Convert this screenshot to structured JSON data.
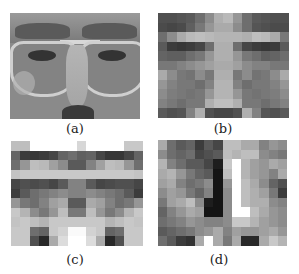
{
  "figure": {
    "panels": [
      {
        "id": "a",
        "label": "(a)",
        "type": "grayscale face photograph (eye region with glasses)"
      },
      {
        "id": "b",
        "label": "(b)",
        "type": "pixelated mosaic of face",
        "cols": 14,
        "rows": 11,
        "cells": [
          [
            80,
            80,
            85,
            90,
            110,
            140,
            175,
            185,
            150,
            110,
            90,
            85,
            80,
            80
          ],
          [
            75,
            70,
            75,
            95,
            120,
            150,
            170,
            170,
            140,
            110,
            85,
            80,
            75,
            75
          ],
          [
            110,
            140,
            170,
            185,
            190,
            185,
            180,
            180,
            180,
            175,
            190,
            185,
            170,
            120
          ],
          [
            90,
            60,
            55,
            60,
            70,
            110,
            175,
            175,
            110,
            70,
            60,
            55,
            60,
            90
          ],
          [
            100,
            95,
            95,
            110,
            120,
            150,
            175,
            175,
            150,
            120,
            110,
            95,
            100,
            110
          ],
          [
            120,
            120,
            130,
            140,
            150,
            160,
            170,
            170,
            160,
            140,
            130,
            130,
            120,
            120
          ],
          [
            170,
            140,
            120,
            115,
            140,
            120,
            175,
            175,
            120,
            140,
            115,
            120,
            140,
            170
          ],
          [
            150,
            130,
            120,
            120,
            110,
            130,
            180,
            180,
            130,
            110,
            120,
            120,
            130,
            150
          ],
          [
            140,
            125,
            120,
            115,
            120,
            150,
            180,
            180,
            150,
            120,
            115,
            120,
            125,
            140
          ],
          [
            130,
            120,
            110,
            120,
            120,
            175,
            190,
            190,
            175,
            120,
            120,
            110,
            120,
            130
          ],
          [
            90,
            80,
            85,
            130,
            175,
            80,
            70,
            70,
            80,
            175,
            130,
            85,
            80,
            90
          ]
        ]
      },
      {
        "id": "c",
        "label": "(c)",
        "type": "pixelated feature mosaic",
        "cols": 14,
        "rows": 11,
        "cells": [
          [
            190,
            190,
            255,
            255,
            255,
            255,
            255,
            215,
            255,
            255,
            255,
            255,
            200,
            200
          ],
          [
            100,
            60,
            55,
            60,
            70,
            100,
            110,
            95,
            100,
            70,
            55,
            55,
            70,
            100
          ],
          [
            110,
            150,
            190,
            185,
            160,
            140,
            90,
            90,
            130,
            160,
            190,
            185,
            150,
            110
          ],
          [
            195,
            200,
            200,
            200,
            200,
            200,
            200,
            200,
            200,
            200,
            200,
            200,
            200,
            195
          ],
          [
            70,
            80,
            75,
            80,
            70,
            90,
            130,
            130,
            90,
            70,
            75,
            80,
            80,
            70
          ],
          [
            60,
            90,
            110,
            120,
            130,
            140,
            130,
            130,
            140,
            130,
            120,
            110,
            90,
            60
          ],
          [
            150,
            120,
            110,
            130,
            160,
            170,
            90,
            90,
            170,
            160,
            130,
            110,
            120,
            150
          ],
          [
            200,
            180,
            140,
            120,
            150,
            190,
            120,
            120,
            190,
            150,
            120,
            140,
            180,
            200
          ],
          [
            195,
            200,
            190,
            180,
            200,
            200,
            200,
            200,
            200,
            200,
            180,
            190,
            200,
            195
          ],
          [
            200,
            200,
            110,
            100,
            200,
            210,
            250,
            250,
            210,
            200,
            100,
            110,
            200,
            200
          ],
          [
            200,
            200,
            80,
            40,
            170,
            220,
            255,
            255,
            220,
            170,
            40,
            80,
            200,
            200
          ]
        ]
      },
      {
        "id": "d",
        "label": "(d)",
        "type": "pixelated feature mosaic",
        "cols": 14,
        "rows": 11,
        "cells": [
          [
            170,
            110,
            90,
            100,
            60,
            90,
            70,
            190,
            190,
            170,
            170,
            130,
            150,
            140
          ],
          [
            140,
            110,
            100,
            110,
            70,
            80,
            90,
            190,
            180,
            190,
            190,
            140,
            130,
            120
          ],
          [
            180,
            130,
            110,
            90,
            90,
            70,
            30,
            200,
            255,
            180,
            160,
            150,
            170,
            160
          ],
          [
            170,
            180,
            150,
            120,
            100,
            90,
            20,
            190,
            255,
            180,
            160,
            150,
            130,
            170
          ],
          [
            160,
            170,
            130,
            110,
            120,
            140,
            20,
            150,
            255,
            190,
            170,
            140,
            100,
            80
          ],
          [
            140,
            160,
            150,
            120,
            100,
            130,
            20,
            140,
            255,
            190,
            175,
            160,
            120,
            60
          ],
          [
            120,
            160,
            170,
            190,
            140,
            30,
            20,
            140,
            255,
            190,
            175,
            175,
            140,
            130
          ],
          [
            100,
            130,
            150,
            170,
            160,
            20,
            20,
            140,
            255,
            255,
            190,
            170,
            150,
            140
          ],
          [
            110,
            120,
            130,
            150,
            140,
            130,
            130,
            140,
            200,
            200,
            180,
            160,
            150,
            140
          ],
          [
            90,
            100,
            110,
            120,
            140,
            150,
            170,
            130,
            160,
            150,
            150,
            160,
            170,
            150
          ],
          [
            110,
            90,
            60,
            50,
            170,
            255,
            170,
            120,
            170,
            40,
            40,
            170,
            200,
            180
          ]
        ]
      }
    ]
  }
}
